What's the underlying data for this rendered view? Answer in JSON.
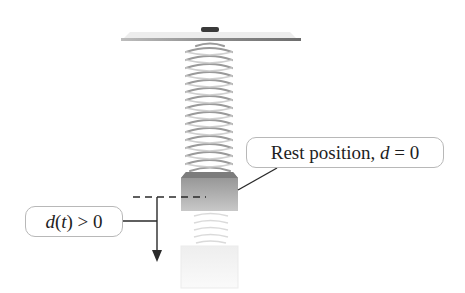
{
  "figure": {
    "type": "spring-mass diagram",
    "labels": {
      "rest_position": {
        "prefix": "Rest position, ",
        "variable": "d",
        "suffix": " = 0"
      },
      "displacement": {
        "function": "d",
        "arg_open": "(",
        "arg": "t",
        "arg_close": ")",
        "relation": " > 0"
      }
    },
    "elements": {
      "ceiling": "horizontal support plate with mounting knob",
      "spring": "coiled spring hanging from the support",
      "mass": "block attached to the bottom of the spring at rest",
      "displaced_mass": "faded block and spring extension below, showing downward displacement",
      "reference_line": "dashed horizontal line at the rest position",
      "direction_arrow": "downward arrow indicating positive displacement"
    },
    "colors": {
      "line": "#2a2a2a",
      "box_border": "#b8b8b8",
      "spring": "#8a8a8a",
      "mass_top": "#9a9a9a",
      "mass_bottom": "#cfcfcf",
      "faded": "#ececec"
    }
  }
}
